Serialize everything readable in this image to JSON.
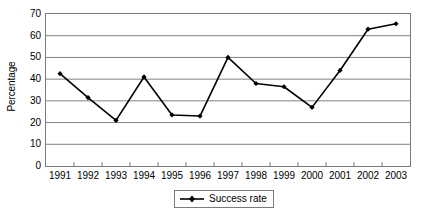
{
  "chart_data": {
    "type": "line",
    "title": "",
    "subtitle": "",
    "xlabel": "",
    "ylabel": "Percentage",
    "categories": [
      "1991",
      "1992",
      "1993",
      "1994",
      "1995",
      "1996",
      "1997",
      "1998",
      "1999",
      "2000",
      "2001",
      "2002",
      "2003"
    ],
    "series": [
      {
        "name": "Success rate",
        "values": [
          42.5,
          31.5,
          21,
          41,
          23.5,
          23,
          50,
          38,
          36.5,
          27,
          44,
          63,
          65.5
        ],
        "color": "#000000",
        "marker": "diamond"
      }
    ],
    "ylim": [
      0,
      70
    ],
    "ytick_step": 10,
    "yticks": [
      "70",
      "60",
      "50",
      "40",
      "30",
      "20",
      "10",
      "0"
    ],
    "grid": "horizontal",
    "grid_color": "#808080",
    "axis_color": "#7b7b7b",
    "legend_position": "bottom-center"
  },
  "legend": {
    "entries": [
      {
        "label": "Success rate",
        "icon": "line-marker-icon"
      }
    ]
  }
}
